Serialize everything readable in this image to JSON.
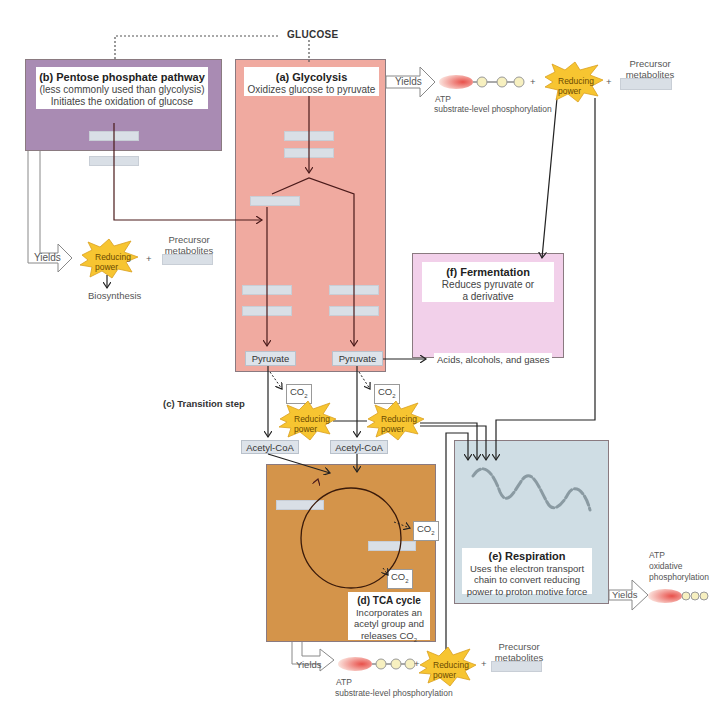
{
  "glucose": "GLUCOSE",
  "colors": {
    "pentose": "#a98bb3",
    "glycolysis": "#f0aaa0",
    "fermentation": "#f2d0ea",
    "tca": "#d4944a",
    "respiration": "#cfdde4",
    "reducing_power": "#f7c531",
    "blank": "#d9dfe6"
  },
  "pentose": {
    "title": "(b) Pentose phosphate pathway",
    "line1": "(less commonly used than glycolysis)",
    "line2": "Initiates the oxidation of glucose",
    "yields": "Yields",
    "reducing_power": [
      "Reducing",
      "power"
    ],
    "plus": "+",
    "precursor": [
      "Precursor",
      "metabolites"
    ],
    "biosynthesis": "Biosynthesis"
  },
  "glycolysis": {
    "title": "(a) Glycolysis",
    "line1": "Oxidizes glucose to pyruvate",
    "pyruvate_left": "Pyruvate",
    "pyruvate_right": "Pyruvate",
    "yields": "Yields",
    "atp": "ATP",
    "atp_note": "substrate-level phosphorylation",
    "plus1": "+",
    "reducing_power": [
      "Reducing",
      "power"
    ],
    "plus2": "+",
    "precursor": [
      "Precursor",
      "metabolites"
    ]
  },
  "fermentation": {
    "title": "(f) Fermentation",
    "line1": "Reduces pyruvate or",
    "line2": "a derivative",
    "products": "Acids, alcohols, and gases"
  },
  "transition": {
    "title": "(c) Transition step",
    "co2_left": "CO",
    "co2_right": "CO",
    "co2_sub": "2",
    "reducing_left": [
      "Reducing",
      "power"
    ],
    "reducing_right": [
      "Reducing",
      "power"
    ],
    "acetyl_left": "Acetyl-CoA",
    "acetyl_right": "Acetyl-CoA"
  },
  "tca": {
    "title": "(d) TCA cycle",
    "line1": "Incorporates an",
    "line2": "acetyl group and",
    "line3": "releases CO",
    "line3_sub": "2",
    "co2_a": "CO",
    "co2_b": "CO",
    "co2_sub": "2",
    "yields": "Yields",
    "atp": "ATP",
    "atp_note": "substrate-level phosphorylation",
    "plus1": "+",
    "reducing_power": [
      "Reducing",
      "power"
    ],
    "plus2": "+",
    "precursor": [
      "Precursor",
      "metabolites"
    ]
  },
  "respiration": {
    "title": "(e) Respiration",
    "line1": "Uses the electron transport",
    "line2": "chain to convert reducing",
    "line3": "power to proton motive force",
    "yields": "Yields",
    "atp": "ATP",
    "atp_note1": "oxidative",
    "atp_note2": "phosphorylation"
  }
}
